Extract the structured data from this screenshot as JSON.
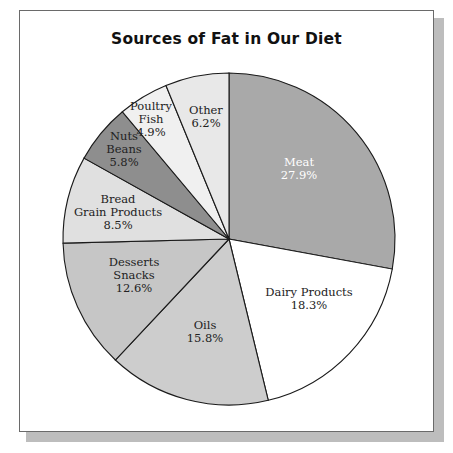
{
  "title": "Sources of Fat in Our Diet",
  "chart_data": {
    "type": "pie",
    "title": "Sources of Fat in Our Diet",
    "categories": [
      "Meat",
      "Dairy Products",
      "Oils",
      "Desserts Snacks",
      "Bread Grain Products",
      "Nuts Beans",
      "Poultry Fish",
      "Other"
    ],
    "values": [
      27.9,
      18.3,
      15.8,
      12.6,
      8.5,
      5.8,
      4.9,
      6.2
    ],
    "unit": "%",
    "start_angle_deg": 0,
    "direction": "clockwise",
    "legend": "none (labels inside slices)",
    "slices": [
      {
        "label_lines": [
          "Meat"
        ],
        "value_text": "27.9%",
        "value": 27.9,
        "color": "#a9a9a9",
        "text_color": "#ffffff",
        "lx": 299,
        "ly": 166
      },
      {
        "label_lines": [
          "Dairy Products"
        ],
        "value_text": "18.3%",
        "value": 18.3,
        "color": "#ffffff",
        "text_color": "#222222",
        "lx": 309,
        "ly": 296
      },
      {
        "label_lines": [
          "Oils"
        ],
        "value_text": "15.8%",
        "value": 15.8,
        "color": "#cdcdcd",
        "text_color": "#222222",
        "lx": 205,
        "ly": 329
      },
      {
        "label_lines": [
          "Desserts",
          "Snacks"
        ],
        "value_text": "12.6%",
        "value": 12.6,
        "color": "#c6c6c6",
        "text_color": "#222222",
        "lx": 134,
        "ly": 266
      },
      {
        "label_lines": [
          "Bread",
          "Grain Products"
        ],
        "value_text": "8.5%",
        "value": 8.5,
        "color": "#e0e0e0",
        "text_color": "#222222",
        "lx": 118,
        "ly": 203
      },
      {
        "label_lines": [
          "Nuts",
          "Beans"
        ],
        "value_text": "5.8%",
        "value": 5.8,
        "color": "#8e8e8e",
        "text_color": "#222222",
        "lx": 124,
        "ly": 140
      },
      {
        "label_lines": [
          "Poultry",
          "Fish"
        ],
        "value_text": "4.9%",
        "value": 4.9,
        "color": "#f0f0f0",
        "text_color": "#222222",
        "lx": 151,
        "ly": 110
      },
      {
        "label_lines": [
          "Other"
        ],
        "value_text": "6.2%",
        "value": 6.2,
        "color": "#e8e8e8",
        "text_color": "#222222",
        "lx": 206,
        "ly": 114
      }
    ]
  }
}
